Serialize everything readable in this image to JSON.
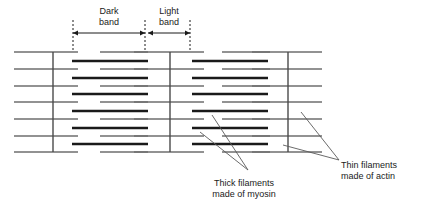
{
  "figure": {
    "title_text": "",
    "colors": {
      "thin_filament": "#6e6e6e",
      "thick_filament": "#1a1a1a",
      "z_line": "#4a4a4a",
      "dashed_guide": "#1a1a1a",
      "arrow": "#1a1a1a",
      "leader": "#5a5a5a",
      "text": "#1a1a1a",
      "background": "#ffffff"
    }
  },
  "annotations": {
    "dark_band": {
      "line1": "Dark",
      "line2": "band",
      "arrow_left_x": 73,
      "arrow_right_x": 145,
      "arrow_y": 33
    },
    "light_band": {
      "line1": "Light",
      "line2": "band",
      "arrow_left_x": 148,
      "arrow_right_x": 190,
      "arrow_y": 33
    },
    "thick_filaments": {
      "line1": "Thick filaments",
      "line2": "made of myosin",
      "text_x": 244,
      "text_y": 186
    },
    "thin_filaments": {
      "line1": "Thin filaments",
      "line2": "made of actin",
      "text_x": 341,
      "text_y": 168
    }
  },
  "structure": {
    "z_lines_x": [
      53,
      170,
      288
    ],
    "thin_rows_y": [
      52,
      69,
      86,
      102,
      119,
      136,
      152
    ],
    "thick_rows_y": [
      61,
      78,
      94,
      111,
      128,
      144
    ],
    "thin_segments": [
      [
        14,
        78
      ],
      [
        100,
        148
      ],
      [
        134,
        204
      ],
      [
        222,
        270
      ],
      [
        252,
        322
      ]
    ],
    "thick_segments": [
      [
        72,
        148
      ],
      [
        192,
        268
      ]
    ],
    "sarcomere_left_x": 14,
    "sarcomere_right_x": 322,
    "dashed_guides_x": [
      73,
      145,
      190
    ],
    "dashed_top_y": 20,
    "dashed_bottom_y": 52
  },
  "leaders": {
    "thick": [
      {
        "from_x": 248,
        "from_y": 170,
        "to_x": 212,
        "to_y": 115
      },
      {
        "from_x": 248,
        "from_y": 170,
        "to_x": 200,
        "to_y": 132
      }
    ],
    "thin": [
      {
        "from_x": 339,
        "from_y": 160,
        "to_x": 301,
        "to_y": 112
      },
      {
        "from_x": 339,
        "from_y": 160,
        "to_x": 283,
        "to_y": 145
      }
    ]
  }
}
